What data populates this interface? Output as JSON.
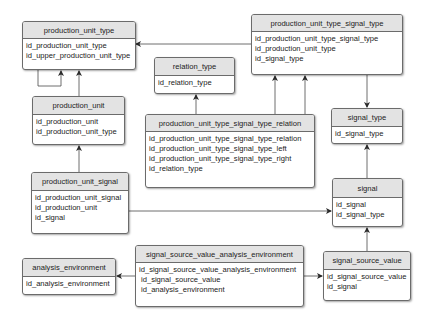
{
  "diagram": {
    "type": "entity-relationship",
    "entities": [
      {
        "id": "production_unit_type",
        "title": "production_unit_type",
        "fields": [
          "id_production_unit_type",
          "id_upper_production_unit_type"
        ]
      },
      {
        "id": "production_unit_type_signal_type",
        "title": "production_unit_type_signal_type",
        "fields": [
          "id_production_unit_type_signal_type",
          "id_production_unit_type",
          "id_signal_type"
        ]
      },
      {
        "id": "relation_type",
        "title": "relation_type",
        "fields": [
          "id_relation_type"
        ]
      },
      {
        "id": "production_unit",
        "title": "production_unit",
        "fields": [
          "id_production_unit",
          "id_production_unit_type"
        ]
      },
      {
        "id": "signal_type",
        "title": "signal_type",
        "fields": [
          "id_signal_type"
        ]
      },
      {
        "id": "production_unit_type_signal_type_relation",
        "title": "production_unit_type_signal_type_relation",
        "fields": [
          "id_production_unit_type_signal_type_relation",
          "id_production_unit_type_signal_type_left",
          "id_production_unit_type_signal_type_right",
          "id_relation_type"
        ]
      },
      {
        "id": "production_unit_signal",
        "title": "production_unit_signal",
        "fields": [
          "id_production_unit_signal",
          "id_production_unit",
          "id_signal"
        ]
      },
      {
        "id": "signal",
        "title": "signal",
        "fields": [
          "id_signal",
          "id_signal_type"
        ]
      },
      {
        "id": "analysis_environment",
        "title": "analysis_environment",
        "fields": [
          "id_analysis_environment"
        ]
      },
      {
        "id": "signal_source_value_analysis_environment",
        "title": "signal_source_value_analysis_environment",
        "fields": [
          "id_signal_source_value_analysis_environment",
          "id_signal_source_value",
          "id_analysis_environment"
        ]
      },
      {
        "id": "signal_source_value",
        "title": "signal_source_value",
        "fields": [
          "id_signal_source_value",
          "id_signal"
        ]
      }
    ],
    "relationships": [
      {
        "from": "production_unit_type",
        "to": "production_unit_type",
        "note": "self-reference"
      },
      {
        "from": "production_unit",
        "to": "production_unit_type"
      },
      {
        "from": "production_unit_type_signal_type",
        "to": "production_unit_type"
      },
      {
        "from": "production_unit_type_signal_type",
        "to": "signal_type"
      },
      {
        "from": "production_unit_type_signal_type_relation",
        "to": "relation_type"
      },
      {
        "from": "production_unit_type_signal_type_relation",
        "to": "production_unit_type_signal_type",
        "note": "left"
      },
      {
        "from": "production_unit_type_signal_type_relation",
        "to": "production_unit_type_signal_type",
        "note": "right"
      },
      {
        "from": "production_unit_signal",
        "to": "production_unit"
      },
      {
        "from": "production_unit_signal",
        "to": "signal"
      },
      {
        "from": "signal",
        "to": "signal_type"
      },
      {
        "from": "signal_source_value",
        "to": "signal"
      },
      {
        "from": "signal_source_value_analysis_environment",
        "to": "analysis_environment"
      },
      {
        "from": "signal_source_value_analysis_environment",
        "to": "signal_source_value"
      }
    ],
    "colors": {
      "header_bg": "#e3e3e3",
      "border": "#6b6b6b",
      "line": "#4a4a4a",
      "text": "#222222"
    }
  }
}
